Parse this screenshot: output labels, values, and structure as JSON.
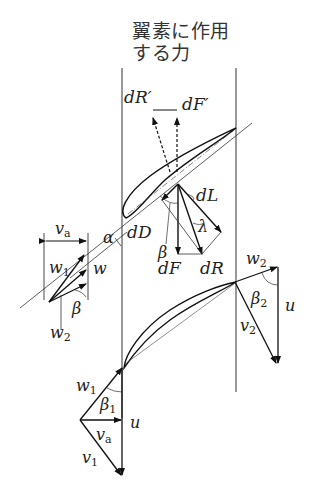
{
  "title": {
    "line1": "翼素に作用",
    "line2": "する力"
  },
  "labels": {
    "dR_prime": "dR′",
    "dF_prime": "dF′",
    "dL": "dL",
    "dD": "dD",
    "dF": "dF",
    "dR": "dR",
    "alpha": "α",
    "beta": "β",
    "lambda": "λ",
    "va_top": {
      "main": "v",
      "sub": "a"
    },
    "w1_left": {
      "main": "w",
      "sub": "1"
    },
    "w_left": "w",
    "beta_left": "β",
    "w2_left": {
      "main": "w",
      "sub": "2"
    },
    "w2_right": {
      "main": "w",
      "sub": "2"
    },
    "beta2": {
      "main": "β",
      "sub": "2"
    },
    "u_right": "u",
    "v2": {
      "main": "v",
      "sub": "2"
    },
    "w1_bottom": {
      "main": "w",
      "sub": "1"
    },
    "beta1": {
      "main": "β",
      "sub": "1"
    },
    "u_bottom": "u",
    "va_bottom": {
      "main": "v",
      "sub": "a"
    },
    "v1": {
      "main": "v",
      "sub": "1"
    }
  },
  "colors": {
    "line": "#222222",
    "text": "#333333",
    "background": "#ffffff"
  }
}
